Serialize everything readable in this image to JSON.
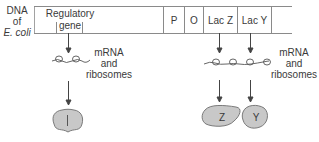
{
  "diagram": {
    "dna_label": {
      "line1": "DNA",
      "line2": "of",
      "line3": "E. coli"
    },
    "dna_segments": [
      {
        "id": "regulatory",
        "line1": "Regulatory",
        "line2": "gene"
      },
      {
        "id": "promoter",
        "label": "P"
      },
      {
        "id": "operator",
        "label": "O"
      },
      {
        "id": "lacz",
        "label": "Lac Z"
      },
      {
        "id": "lacy",
        "label": "Lac Y"
      }
    ],
    "left_transcript": {
      "line1": "mRNA",
      "line2": "and",
      "line3": "ribosomes"
    },
    "right_transcript": {
      "line1": "mRNA",
      "line2": "and",
      "line3": "ribosomes"
    },
    "proteins": [
      {
        "id": "repressor",
        "label": "I"
      },
      {
        "id": "beta-galactosidase",
        "label": "Z"
      },
      {
        "id": "permease",
        "label": "Y"
      }
    ],
    "colors": {
      "line": "#8a8a8a",
      "protein_fill": "#c8c8c8",
      "protein_stroke": "#6e6e6e"
    }
  }
}
